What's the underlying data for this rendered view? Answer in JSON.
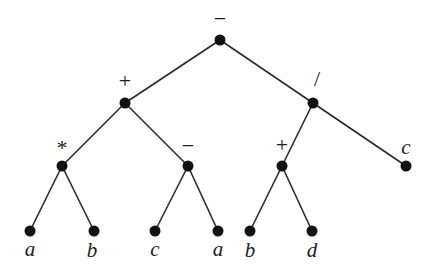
{
  "diagram": {
    "type": "expression-tree",
    "nodes": [
      {
        "id": "root",
        "label": "−",
        "kind": "operator",
        "x": 220,
        "y": 40,
        "lx": 220,
        "ly": 26
      },
      {
        "id": "plus1",
        "label": "+",
        "kind": "operator",
        "x": 125,
        "y": 103,
        "lx": 125,
        "ly": 88
      },
      {
        "id": "div",
        "label": "/",
        "kind": "operator",
        "x": 313,
        "y": 103,
        "lx": 317,
        "ly": 86
      },
      {
        "id": "mul",
        "label": "*",
        "kind": "operator",
        "x": 62,
        "y": 166,
        "lx": 62,
        "ly": 155
      },
      {
        "id": "minus2",
        "label": "−",
        "kind": "operator",
        "x": 188,
        "y": 166,
        "lx": 188,
        "ly": 153
      },
      {
        "id": "plus2",
        "label": "+",
        "kind": "operator",
        "x": 282,
        "y": 166,
        "lx": 282,
        "ly": 152
      },
      {
        "id": "leafC1",
        "label": "c",
        "kind": "operand",
        "x": 406,
        "y": 166,
        "lx": 406,
        "ly": 154
      },
      {
        "id": "leafA1",
        "label": "a",
        "kind": "operand",
        "x": 30,
        "y": 231,
        "lx": 30,
        "ly": 256
      },
      {
        "id": "leafB1",
        "label": "b",
        "kind": "operand",
        "x": 94,
        "y": 231,
        "lx": 92,
        "ly": 257
      },
      {
        "id": "leafC2",
        "label": "c",
        "kind": "operand",
        "x": 155,
        "y": 231,
        "lx": 155,
        "ly": 256
      },
      {
        "id": "leafA2",
        "label": "a",
        "kind": "operand",
        "x": 218,
        "y": 231,
        "lx": 218,
        "ly": 256
      },
      {
        "id": "leafB2",
        "label": "b",
        "kind": "operand",
        "x": 250,
        "y": 231,
        "lx": 250,
        "ly": 257
      },
      {
        "id": "leafD",
        "label": "d",
        "kind": "operand",
        "x": 312,
        "y": 231,
        "lx": 312,
        "ly": 257
      }
    ],
    "edges": [
      [
        "root",
        "plus1"
      ],
      [
        "root",
        "div"
      ],
      [
        "plus1",
        "mul"
      ],
      [
        "plus1",
        "minus2"
      ],
      [
        "div",
        "plus2"
      ],
      [
        "div",
        "leafC1"
      ],
      [
        "mul",
        "leafA1"
      ],
      [
        "mul",
        "leafB1"
      ],
      [
        "minus2",
        "leafC2"
      ],
      [
        "minus2",
        "leafA2"
      ],
      [
        "plus2",
        "leafB2"
      ],
      [
        "plus2",
        "leafD"
      ]
    ],
    "expression": "((a * b) + (c − a)) − ((b + d) / c)"
  }
}
